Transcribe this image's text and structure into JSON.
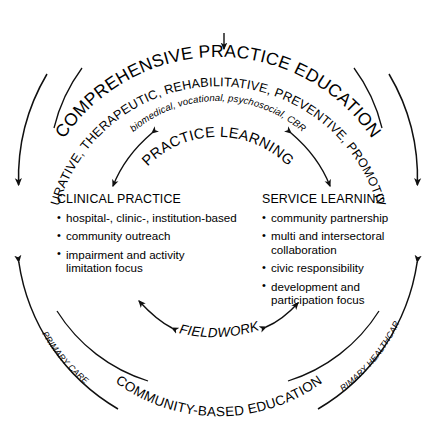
{
  "diagram": {
    "outer_ring_label": "COMPREHENSIVE PRACTICE EDUCATION",
    "inner_ring_label": "CURATIVE, THERAPEUTIC, REHABILITATIVE, PREVENTIVE, PROMOTIVE",
    "approaches_label": "biomedical, vocational, psychosocial, CBR",
    "practice_learning_label": "PRACTICE LEARNING",
    "fieldwork_label": "FIELDWORK",
    "bottom_ring_label": "COMMUNITY-BASED EDUCATION",
    "left_side_label": "PRIMARY CARE",
    "right_side_label": "PRIMARY HEALTHCARE",
    "columns": [
      {
        "heading": "CLINICAL PRACTICE",
        "bullets": [
          "hospital-, clinic-, institution-based",
          "community outreach",
          "impairment and activity\nlimitation focus"
        ]
      },
      {
        "heading": "SERVICE LEARNING",
        "bullets": [
          "community partnership",
          "multi and intersectoral\ncollaboration",
          "civic responsibility",
          "development and\nparticipation focus"
        ]
      }
    ],
    "colors": {
      "stroke": "#101010",
      "text": "#000000",
      "background": "#ffffff"
    }
  }
}
